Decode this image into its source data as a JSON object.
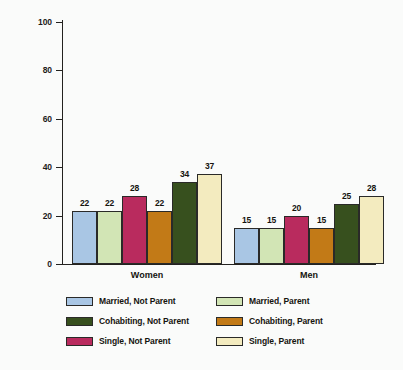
{
  "chart_data": {
    "type": "bar",
    "title": "",
    "xlabel": "",
    "ylabel": "Percentage",
    "ylim": [
      0,
      100
    ],
    "yticks": [
      0,
      20,
      40,
      60,
      80,
      100
    ],
    "grid": false,
    "legend_position": "bottom",
    "categories": [
      "Women",
      "Men"
    ],
    "series": [
      {
        "name": "Married, Not Parent",
        "color": "#a9c6e4",
        "values": [
          22,
          15
        ]
      },
      {
        "name": "Married, Parent",
        "color": "#d2e5b5",
        "values": [
          22,
          15
        ]
      },
      {
        "name": "Single, Not Parent",
        "color": "#b92b5e",
        "values": [
          28,
          20
        ]
      },
      {
        "name": "Cohabiting, Parent",
        "color": "#c27a17",
        "values": [
          22,
          15
        ]
      },
      {
        "name": "Cohabiting, Not Parent",
        "color": "#37501e",
        "values": [
          34,
          25
        ]
      },
      {
        "name": "Single, Parent",
        "color": "#f3ebbf",
        "values": [
          37,
          28
        ]
      }
    ],
    "legend_order": [
      {
        "name": "Married, Not Parent",
        "color": "#a9c6e4"
      },
      {
        "name": "Married, Parent",
        "color": "#d2e5b5"
      },
      {
        "name": "Cohabiting, Not Parent",
        "color": "#37501e"
      },
      {
        "name": "Cohabiting, Parent",
        "color": "#c27a17"
      },
      {
        "name": "Single, Not Parent",
        "color": "#b92b5e"
      },
      {
        "name": "Single, Parent",
        "color": "#f3ebbf"
      }
    ]
  }
}
